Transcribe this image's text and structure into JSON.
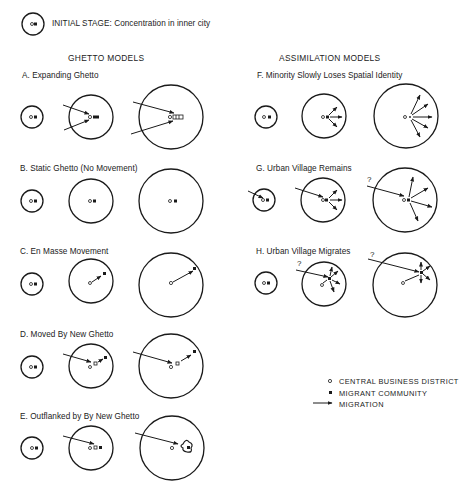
{
  "initial_stage": {
    "label": "INITIAL STAGE: Concentration in inner city"
  },
  "sections": {
    "ghetto": {
      "title": "GHETTO MODELS"
    },
    "assimilation": {
      "title": "ASSIMILATION MODELS"
    }
  },
  "models": [
    {
      "id": "A",
      "label": "A. Expanding Ghetto",
      "group": "ghetto"
    },
    {
      "id": "B",
      "label": "B. Static Ghetto (No Movement)",
      "group": "ghetto"
    },
    {
      "id": "C",
      "label": "C. En Masse Movement",
      "group": "ghetto"
    },
    {
      "id": "D",
      "label": "D. Moved By New Ghetto",
      "group": "ghetto"
    },
    {
      "id": "E",
      "label": "E. Outflanked by By New Ghetto",
      "group": "ghetto"
    },
    {
      "id": "F",
      "label": "F. Minority Slowly Loses  Spatial Identity",
      "group": "assimilation"
    },
    {
      "id": "G",
      "label": "G. Urban Village Remains",
      "group": "assimilation"
    },
    {
      "id": "H",
      "label": "H. Urban Village Migrates",
      "group": "assimilation"
    }
  ],
  "question_mark": "?",
  "legend": {
    "items": [
      {
        "symbol": "open-circle",
        "label": "CENTRAL BUSINESS DISTRICT"
      },
      {
        "symbol": "filled-square",
        "label": "MIGRANT COMMUNITY"
      },
      {
        "symbol": "arrow",
        "label": "MIGRATION"
      }
    ]
  },
  "colors": {
    "ink": "#1a1a1a",
    "background": "#ffffff"
  }
}
